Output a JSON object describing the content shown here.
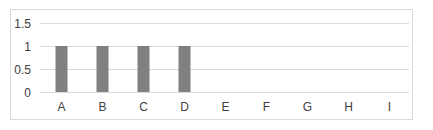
{
  "chart_data": {
    "type": "bar",
    "title": "",
    "xlabel": "",
    "ylabel": "",
    "categories": [
      "A",
      "B",
      "C",
      "D",
      "E",
      "F",
      "G",
      "H",
      "I"
    ],
    "values": [
      1,
      1,
      1,
      1,
      null,
      null,
      null,
      null,
      null
    ],
    "ylim": [
      0,
      1.5
    ],
    "yticks": [
      0,
      0.5,
      1,
      1.5
    ],
    "ytick_labels": [
      "0",
      "0.5",
      "1",
      "1.5"
    ],
    "grid": true,
    "legend": "none",
    "colors": {
      "bar": "#808080",
      "grid": "#d9d9d9",
      "border": "#d9d9d9",
      "text": "#404040"
    }
  }
}
